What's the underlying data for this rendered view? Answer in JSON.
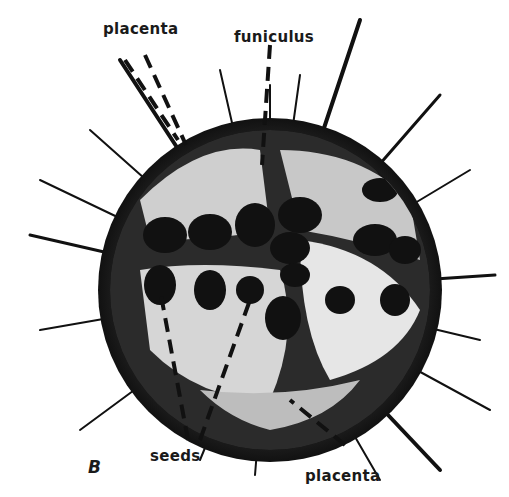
{
  "figure": {
    "panel_letter": "B"
  },
  "labels": [
    {
      "id": "placenta_top",
      "text": "placenta",
      "x": 103,
      "y": 20
    },
    {
      "id": "funiculus",
      "text": "funiculus",
      "x": 234,
      "y": 28
    },
    {
      "id": "seeds",
      "text": "seeds",
      "x": 150,
      "y": 447
    },
    {
      "id": "placenta_bottom",
      "text": "placenta",
      "x": 305,
      "y": 467
    }
  ],
  "colors": {
    "background": "#ffffff",
    "fruit_dark": "#1c1c1c",
    "tissue_light": "#d8d8d8",
    "text": "#1a1a1a"
  }
}
